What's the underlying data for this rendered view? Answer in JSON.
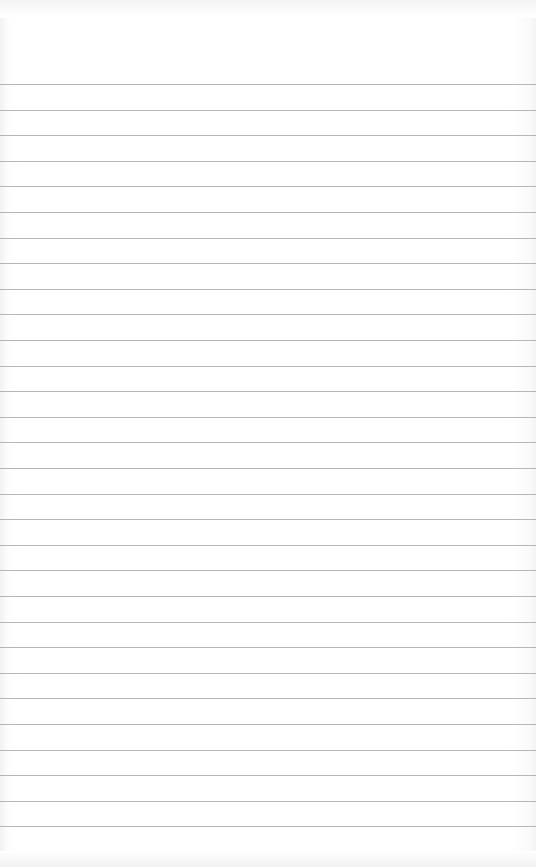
{
  "paper": {
    "type": "lined notebook paper",
    "background_color": "#ffffff",
    "line_color": "#a9a9a9",
    "line_count": 31,
    "first_line_y": 84,
    "line_spacing": 25.6
  }
}
